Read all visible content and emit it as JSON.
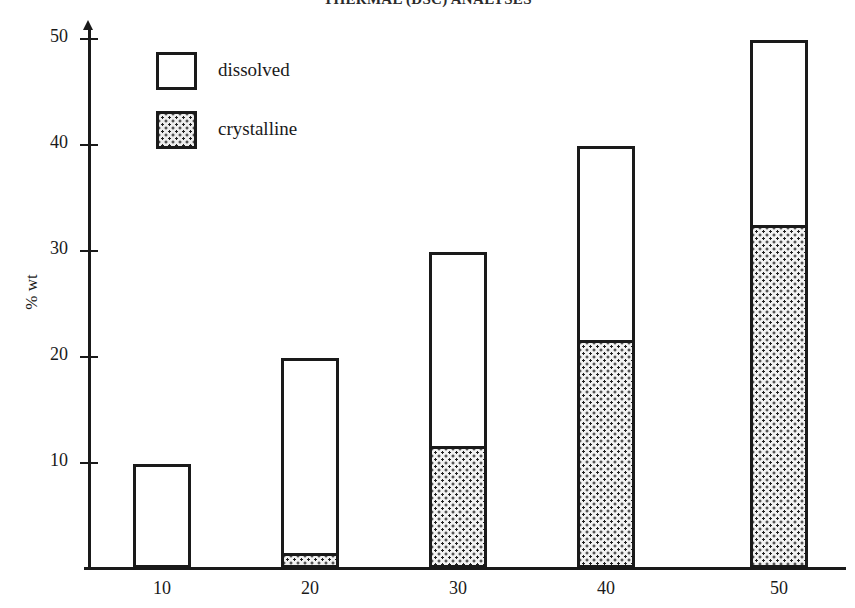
{
  "chart_data": {
    "type": "bar",
    "stacked": true,
    "title": "THERMAL (DSC) ANALYSES",
    "xlabel": "",
    "ylabel": "% wt",
    "categories": [
      "10",
      "20",
      "30",
      "40",
      "50"
    ],
    "series": [
      {
        "name": "crystalline",
        "values": [
          0,
          1.4,
          11.5,
          21.5,
          32.4
        ]
      },
      {
        "name": "dissolved",
        "values": [
          9.8,
          18.4,
          18.3,
          18.3,
          17.4
        ]
      }
    ],
    "totals": [
      9.8,
      19.8,
      29.8,
      39.8,
      49.8
    ],
    "ylim": [
      0,
      50
    ],
    "yticks": [
      10,
      20,
      30,
      40,
      50
    ],
    "ytick_labels": [
      "10",
      "20",
      "30",
      "40",
      "50"
    ],
    "xtick_labels": [
      "10",
      "20",
      "30",
      "40",
      "50"
    ],
    "grid": false,
    "legend_position": "upper-left",
    "legend": [
      {
        "label": "dissolved",
        "fill": "white"
      },
      {
        "label": "crystalline",
        "fill": "stipple"
      }
    ],
    "colors": {
      "outline": "#1a1a1a",
      "dissolved": "#ffffff",
      "crystalline_dots": "#1f1f1f",
      "crystalline_bg": "#f2f2f2",
      "background": "#ffffff"
    }
  },
  "geometry": {
    "baseline_y": 568,
    "px_per_unit": 10.6,
    "bar_width": 58,
    "bar_centers_x": [
      162,
      310,
      458,
      606,
      779
    ],
    "y_tick_y": [
      462,
      356,
      250,
      144,
      38
    ],
    "x_label_x": [
      162,
      310,
      458,
      606,
      779
    ]
  }
}
